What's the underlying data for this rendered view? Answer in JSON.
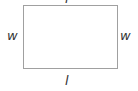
{
  "diagram": {
    "shape": "rectangle",
    "stroke_color": "#a0a0a0",
    "labels": {
      "top": "l",
      "bottom": "l",
      "left": "w",
      "right": "w"
    }
  }
}
